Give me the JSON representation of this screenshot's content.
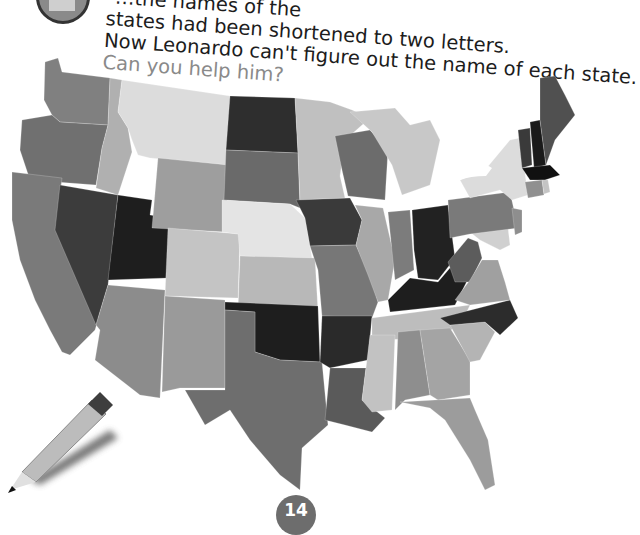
{
  "page": {
    "intro_lines": [
      "…the names of the",
      "states had been shortened to two letters.",
      "Now Leonardo can't figure out the name of each state."
    ],
    "question": "Can you help him?",
    "page_number": "14"
  },
  "map": {
    "subject": "United States (contiguous 48 states)",
    "style": "grayscale",
    "state_labels_visible": false
  },
  "colors": {
    "text": "#1c1c1c",
    "question_text": "#8a8a8a",
    "page_badge": "#6d6d6d",
    "shades": {
      "black": "#1e1e1e",
      "dark": "#3c3c3c",
      "mid_dark": "#606060",
      "mid": "#808080",
      "mid_light": "#9e9e9e",
      "light": "#bdbdbd",
      "pale": "#dcdcdc"
    }
  },
  "decorations": {
    "pencil": "pencil-illustration",
    "avatar": "leonardo-avatar"
  }
}
